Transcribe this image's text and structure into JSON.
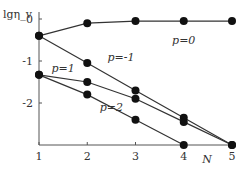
{
  "chart_data": {
    "type": "line",
    "title": "",
    "xlabel": "N",
    "ylabel": "lgη_v",
    "x": [
      1,
      2,
      3,
      4,
      5
    ],
    "xlim": [
      1,
      5
    ],
    "ylim": [
      -3.0,
      0.0
    ],
    "yticks": [
      0,
      -1,
      -2
    ],
    "ytick_labels": [
      "0",
      "-1",
      "-2"
    ],
    "xtick_labels": [
      "1",
      "2",
      "3",
      "4",
      "5"
    ],
    "grid": false,
    "legend": "inline labels",
    "series": [
      {
        "name": "p=0",
        "values": [
          -0.4,
          -0.1,
          -0.05,
          -0.05,
          -0.05
        ]
      },
      {
        "name": "p=-1",
        "values": [
          -0.4,
          -1.05,
          -1.7,
          -2.35,
          -3.0
        ]
      },
      {
        "name": "p=1",
        "values": [
          -1.33,
          -1.5,
          -1.9,
          -2.45,
          -3.0
        ]
      },
      {
        "name": "p=2",
        "values": [
          -1.33,
          -1.8,
          -2.4,
          -3.0,
          null
        ]
      }
    ],
    "annotations": [
      {
        "text": "p=0",
        "x": 4,
        "y": -0.6
      },
      {
        "text": "p=-1",
        "x": 2.7,
        "y": -1.0
      },
      {
        "text": "p=1",
        "x": 1.5,
        "y": -1.25
      },
      {
        "text": "p=2",
        "x": 2.5,
        "y": -2.2
      }
    ]
  }
}
